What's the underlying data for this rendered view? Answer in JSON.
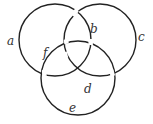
{
  "diagram": {
    "type": "three interlocking circles",
    "stroke_color": "#222222",
    "background": "#ffffff",
    "circles": [
      {
        "id": "A",
        "cx": 55,
        "cy": 40,
        "r": 36
      },
      {
        "id": "C",
        "cx": 100,
        "cy": 40,
        "r": 36
      },
      {
        "id": "E",
        "cx": 78,
        "cy": 78,
        "r": 37
      }
    ],
    "labels": {
      "a": "a",
      "b": "b",
      "c": "c",
      "d": "d",
      "e": "e",
      "f": "f"
    }
  }
}
